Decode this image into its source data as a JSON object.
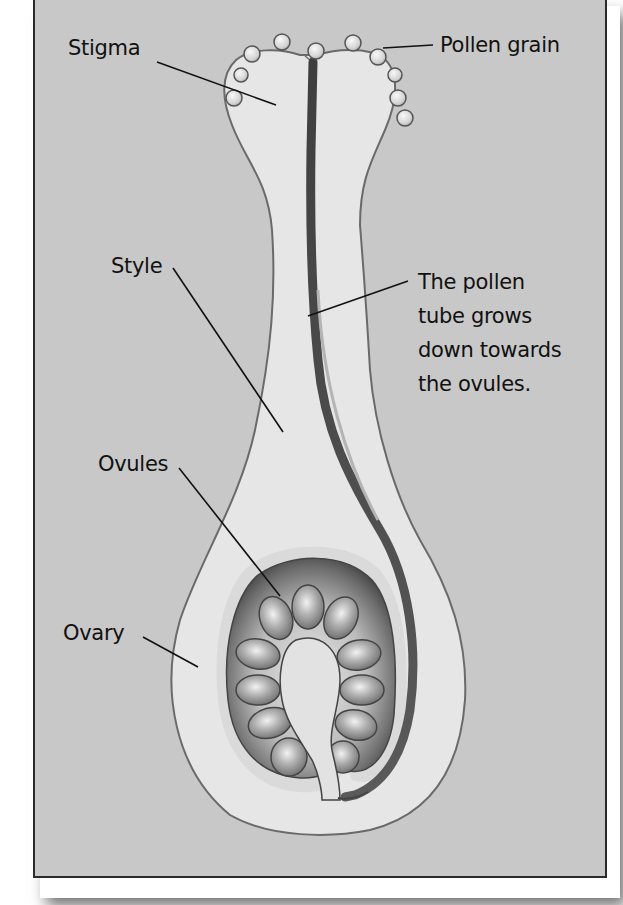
{
  "figure": {
    "colors": {
      "background": "#c8c8c8",
      "frame_border": "#2a2a2a",
      "pistil_fill": "#e6e6e6",
      "pistil_outline": "#6a6a6a",
      "pollen_tube": "#4a4a4a",
      "ovule_fill": "#9a9a9a",
      "ovary_cavity": "#5a5a5a",
      "label_text": "#111111"
    }
  },
  "labels": {
    "stigma": "Stigma",
    "pollen_grain": "Pollen grain",
    "style": "Style",
    "pollen_tube_line1": "The pollen",
    "pollen_tube_line2": "tube grows",
    "pollen_tube_line3": "down towards",
    "pollen_tube_line4": "the ovules.",
    "ovules": "Ovules",
    "ovary": "Ovary"
  },
  "structures": {
    "pollen_grains_count": 11,
    "ovules_count": 12
  }
}
